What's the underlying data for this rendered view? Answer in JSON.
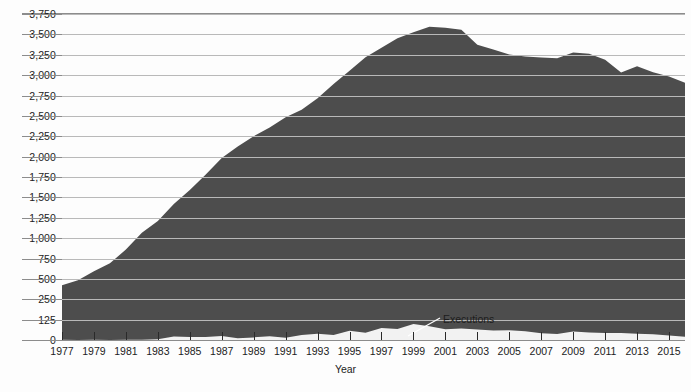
{
  "chart_data": {
    "type": "area",
    "title": "",
    "xlabel": "Year",
    "ylabel": "",
    "grid": true,
    "legend_position": "inline-annotation",
    "x": [
      1977,
      1978,
      1979,
      1980,
      1981,
      1982,
      1983,
      1984,
      1985,
      1986,
      1987,
      1988,
      1989,
      1990,
      1991,
      1992,
      1993,
      1994,
      1995,
      1996,
      1997,
      1998,
      1999,
      2000,
      2001,
      2002,
      2003,
      2004,
      2005,
      2006,
      2007,
      2008,
      2009,
      2010,
      2011,
      2012,
      2013,
      2014,
      2015,
      2016
    ],
    "xlim": [
      1977,
      2016
    ],
    "ylim": [
      0,
      3875
    ],
    "y_tick_values": [
      0,
      125,
      250,
      500,
      750,
      1000,
      1250,
      1500,
      1750,
      2000,
      2250,
      2500,
      2750,
      3000,
      3250,
      3500,
      3750
    ],
    "y_tick_labels": [
      "0",
      "125",
      "250",
      "500",
      "750",
      "1,000",
      "1,250",
      "1,500",
      "1,750",
      "2,000",
      "2,250",
      "2,500",
      "2,750",
      "3,000",
      "3,250",
      "3,500",
      "3,750"
    ],
    "x_tick_values": [
      1977,
      1979,
      1981,
      1983,
      1985,
      1987,
      1989,
      1991,
      1993,
      1995,
      1997,
      1999,
      2001,
      2003,
      2005,
      2007,
      2009,
      2011,
      2013,
      2015
    ],
    "x_tick_labels": [
      "1977",
      "1979",
      "1981",
      "1983",
      "1985",
      "1987",
      "1989",
      "1991",
      "1993",
      "1995",
      "1997",
      "1999",
      "2001",
      "2003",
      "2005",
      "2007",
      "2009",
      "2011",
      "2013",
      "2015"
    ],
    "series": [
      {
        "name": "Death row population",
        "color": "#4d4d4d",
        "values": [
          423,
          482,
          593,
          691,
          860,
          1066,
          1209,
          1420,
          1591,
          1781,
          1984,
          2124,
          2250,
          2356,
          2482,
          2575,
          2716,
          2890,
          3054,
          3219,
          3335,
          3452,
          3527,
          3593,
          3581,
          3557,
          3374,
          3315,
          3254,
          3228,
          3215,
          3207,
          3279,
          3261,
          3189,
          3033,
          3108,
          3035,
          2984,
          2905
        ]
      },
      {
        "name": "Executions",
        "color": "#f2f2f2",
        "values": [
          1,
          0,
          2,
          0,
          1,
          2,
          5,
          21,
          18,
          18,
          25,
          11,
          16,
          23,
          14,
          31,
          38,
          31,
          56,
          45,
          74,
          68,
          98,
          85,
          66,
          71,
          65,
          59,
          60,
          53,
          42,
          37,
          52,
          46,
          43,
          43,
          39,
          35,
          28,
          20
        ]
      }
    ],
    "annotations": [
      {
        "name": "executions-label",
        "text": "Executions",
        "points_to_year": 1997
      }
    ]
  },
  "axis": {
    "x_title": "Year"
  },
  "colors": {
    "population_fill": "#4d4d4d",
    "executions_fill": "#f2f2f2",
    "gridline": "#b9b9b9",
    "axis_rule": "#8c8c8c",
    "text": "#1c1c1c"
  }
}
